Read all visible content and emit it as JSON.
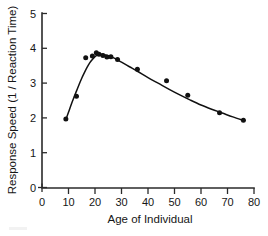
{
  "chart_data": {
    "type": "scatter",
    "title": "",
    "subtitle": "",
    "xlabel": "Age of Individual",
    "ylabel": "Response Speed (1 / Reaction Time)",
    "xlim": [
      0,
      80
    ],
    "ylim": [
      0,
      5
    ],
    "xticks": [
      0,
      10,
      20,
      30,
      40,
      50,
      60,
      70,
      80
    ],
    "yticks": [
      0,
      1,
      2,
      3,
      4,
      5
    ],
    "xtick_labels": [
      "0",
      "10",
      "20",
      "30",
      "40",
      "50",
      "60",
      "70",
      "80"
    ],
    "ytick_labels": [
      "0",
      "1",
      "2",
      "3",
      "4",
      "5"
    ],
    "grid": false,
    "legend": false,
    "legend_position": "none",
    "marker": "filled-circle",
    "marker_color": "#111111",
    "curve_color": "#111111",
    "background_color": "#ffffff",
    "series": [
      {
        "name": "Observed individuals",
        "kind": "scatter",
        "x": [
          9,
          13,
          16.5,
          19,
          20.5,
          21.5,
          23,
          24.5,
          26,
          28.5,
          36,
          47,
          55,
          67,
          76
        ],
        "y": [
          1.97,
          2.62,
          3.73,
          3.78,
          3.87,
          3.83,
          3.79,
          3.75,
          3.76,
          3.68,
          3.4,
          3.07,
          2.65,
          2.15,
          1.93
        ]
      },
      {
        "name": "Fitted curve",
        "kind": "line",
        "x": [
          9,
          10,
          11,
          12,
          13,
          14,
          15,
          16,
          17,
          18,
          19,
          20,
          21,
          22,
          23,
          24,
          25,
          26,
          28,
          30,
          33,
          36,
          40,
          44,
          48,
          52,
          56,
          60,
          64,
          68,
          72,
          76
        ],
        "y": [
          1.95,
          2.16,
          2.38,
          2.58,
          2.77,
          2.96,
          3.14,
          3.3,
          3.45,
          3.58,
          3.68,
          3.76,
          3.81,
          3.83,
          3.83,
          3.81,
          3.79,
          3.76,
          3.69,
          3.6,
          3.47,
          3.34,
          3.16,
          2.99,
          2.82,
          2.66,
          2.51,
          2.37,
          2.25,
          2.14,
          2.03,
          1.93
        ]
      }
    ],
    "annotations": []
  },
  "axes": {
    "x_title": "Age of Individual",
    "y_title": "Response Speed (1 / Reaction Time)"
  }
}
